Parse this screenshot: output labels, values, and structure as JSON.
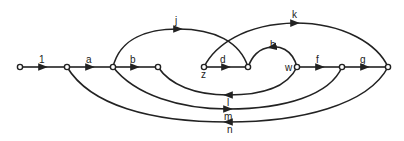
{
  "diagram": {
    "type": "signal-flow-graph",
    "nodes": [
      {
        "id": "n0",
        "x": 20,
        "y": 67,
        "label": ""
      },
      {
        "id": "n1",
        "x": 67,
        "y": 67,
        "label": ""
      },
      {
        "id": "n2",
        "x": 113,
        "y": 67,
        "label": ""
      },
      {
        "id": "n3",
        "x": 158,
        "y": 67,
        "label": ""
      },
      {
        "id": "z",
        "x": 204,
        "y": 67,
        "label": "z"
      },
      {
        "id": "n5",
        "x": 248,
        "y": 67,
        "label": ""
      },
      {
        "id": "w",
        "x": 297,
        "y": 67,
        "label": "w"
      },
      {
        "id": "n7",
        "x": 342,
        "y": 67,
        "label": ""
      },
      {
        "id": "n8",
        "x": 388,
        "y": 67,
        "label": ""
      }
    ],
    "edges": [
      {
        "label": "1",
        "from": "n0",
        "to": "n1"
      },
      {
        "label": "a",
        "from": "n1",
        "to": "n2"
      },
      {
        "label": "b",
        "from": "n2",
        "to": "n3"
      },
      {
        "label": "d",
        "from": "z",
        "to": "n5"
      },
      {
        "label": "h",
        "from": "w",
        "to": "n5"
      },
      {
        "label": "f",
        "from": "w",
        "to": "n7"
      },
      {
        "label": "g",
        "from": "n7",
        "to": "n8"
      },
      {
        "label": "j",
        "from": "n2",
        "to": "n5"
      },
      {
        "label": "k",
        "from": "z",
        "to": "n8"
      },
      {
        "label": "l",
        "from": "w",
        "to": "n3"
      },
      {
        "label": "m",
        "from": "n2",
        "to": "n7"
      },
      {
        "label": "n",
        "from": "n8",
        "to": "n1"
      }
    ]
  },
  "labels": {
    "e1": "1",
    "a": "a",
    "b": "b",
    "d": "d",
    "h": "h",
    "f": "f",
    "g": "g",
    "j": "j",
    "k": "k",
    "l": "l",
    "m": "m",
    "n": "n",
    "z": "z",
    "w": "w"
  }
}
